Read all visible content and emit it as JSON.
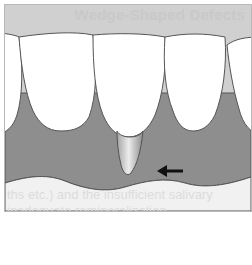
{
  "figure": {
    "background_text": {
      "title": "Wedge-Shaped Defects",
      "line1": "ths etc.) and the insufficient salivary",
      "line2": "inadequate remineralization"
    },
    "colors": {
      "background": "#d0d0d0",
      "gum": "#8e8e8e",
      "tooth": "#ffffff",
      "outline": "#555555",
      "defect_light": "#e8e8e8",
      "defect_dark": "#9a9a9a",
      "arrow": "#111111",
      "lower_panel": "#f1f1f1"
    },
    "elements": {
      "teeth_count": 4,
      "defect_tooth_index": 2,
      "arrow_direction": "left"
    }
  }
}
